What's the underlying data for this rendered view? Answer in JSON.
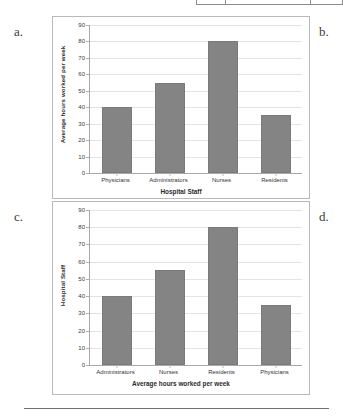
{
  "figure": {
    "panel_labels": {
      "a": "a.",
      "b": "b.",
      "c": "c.",
      "d": "d."
    }
  },
  "chart_data": [
    {
      "id": "chart-a",
      "panel": "a.",
      "type": "bar",
      "title": "",
      "categories": [
        "Physicians",
        "Administrators",
        "Nurses",
        "Residents"
      ],
      "values": [
        40,
        55,
        80,
        35
      ],
      "xlabel": "Hospital Staff",
      "ylabel": "Average hours worked per week",
      "ylim": [
        0,
        90
      ],
      "ytick_step": 10,
      "yticks": [
        90,
        80,
        70,
        60,
        50,
        40,
        30,
        20,
        10,
        0
      ],
      "grid": true,
      "legend": false,
      "bar_color": "#848484"
    },
    {
      "id": "chart-c",
      "panel": "c.",
      "type": "bar",
      "title": "",
      "categories": [
        "Administrators",
        "Nurses",
        "Residents",
        "Physicians"
      ],
      "values": [
        40,
        55,
        80,
        35
      ],
      "xlabel": "Average hours worked per week",
      "ylabel": "Hospital Staff",
      "ylim": [
        0,
        90
      ],
      "ytick_step": 10,
      "yticks": [
        90,
        80,
        70,
        60,
        50,
        40,
        30,
        20,
        10,
        0
      ],
      "grid": true,
      "legend": false,
      "bar_color": "#848484"
    }
  ]
}
